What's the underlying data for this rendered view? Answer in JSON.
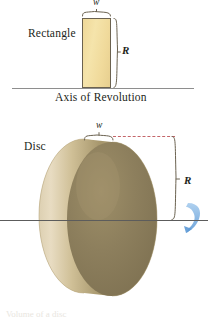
{
  "figure": {
    "kind": "disc-method-illustration",
    "background_color": "#ffffff",
    "top_panel": {
      "shape_label": "Rectangle",
      "width_label": "w",
      "radius_label": "R",
      "axis_caption": "Axis of Revolution",
      "shape_fill_color": "#f0da9b",
      "shape_stroke_color": "#6b6250",
      "axis_color": "#8e8e8e",
      "brace_color": "#6b6250"
    },
    "bottom_panel": {
      "shape_label": "Disc",
      "width_label": "w",
      "radius_label": "R",
      "dashed_guide_color": "#c4666a",
      "axis_color": "#5c5c5c",
      "solid_light_color": "#e8dcc2",
      "solid_mid_color": "#c9b98f",
      "solid_dark_color": "#8a7c5c",
      "rotation_arrow_color": "#7fb2e5"
    },
    "bottom_caption": "Volume of a disc"
  }
}
